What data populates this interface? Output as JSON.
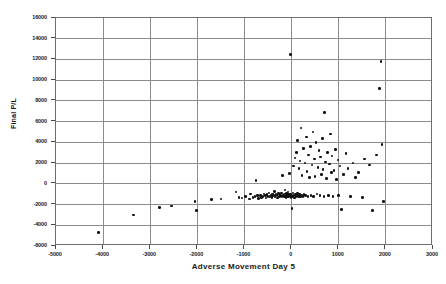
{
  "chart_data": {
    "type": "scatter",
    "title": "",
    "xlabel": "Adverse Movement Day 5",
    "ylabel": "Final P/L",
    "xlim": [
      -5000,
      3000
    ],
    "ylim": [
      -6000,
      16000
    ],
    "xticks": [
      -5000,
      -4000,
      -3000,
      -2000,
      -1000,
      0,
      1000,
      2000,
      3000
    ],
    "xtick_labels": [
      "-5000",
      "-4000",
      "-3000",
      "-2000",
      "-1000",
      "0",
      "1000",
      "2000",
      "3000"
    ],
    "yticks": [
      -6000,
      -4000,
      -2000,
      0,
      2000,
      4000,
      6000,
      8000,
      10000,
      12000,
      14000,
      16000
    ],
    "ytick_labels": [
      "-6000",
      "-4000",
      "-2000",
      "0",
      "2000",
      "4000",
      "6000",
      "8000",
      "10000",
      "12000",
      "14000",
      "16000"
    ],
    "grid": true,
    "grid_axis": "both",
    "legend": false,
    "marker": "filled-circle",
    "marker_color": "#111111",
    "series": [
      {
        "name": "trades",
        "points": [
          [
            -4100,
            -4700
          ],
          [
            -3350,
            -3000
          ],
          [
            -2800,
            -2300
          ],
          [
            -2550,
            -2150
          ],
          [
            -2050,
            -1700
          ],
          [
            -2020,
            -2600
          ],
          [
            -1700,
            -1500
          ],
          [
            -1500,
            -1450
          ],
          [
            -1180,
            -800
          ],
          [
            -1120,
            -1300
          ],
          [
            -1050,
            -1350
          ],
          [
            -980,
            -1200
          ],
          [
            -900,
            -1450
          ],
          [
            -870,
            -1000
          ],
          [
            -820,
            -1300
          ],
          [
            -780,
            -1250
          ],
          [
            -760,
            300
          ],
          [
            -720,
            -1150
          ],
          [
            -700,
            -1400
          ],
          [
            -660,
            -1100
          ],
          [
            -640,
            -1300
          ],
          [
            -610,
            -1200
          ],
          [
            -590,
            -1000
          ],
          [
            -560,
            -1150
          ],
          [
            -540,
            -1350
          ],
          [
            -520,
            -1050
          ],
          [
            -500,
            -1250
          ],
          [
            -480,
            -900
          ],
          [
            -460,
            -1200
          ],
          [
            -440,
            -1100
          ],
          [
            -420,
            -1300
          ],
          [
            -400,
            -1000
          ],
          [
            -380,
            -1150
          ],
          [
            -360,
            -750
          ],
          [
            -350,
            -1250
          ],
          [
            -330,
            -1050
          ],
          [
            -310,
            -1150
          ],
          [
            -300,
            -1350
          ],
          [
            -280,
            -950
          ],
          [
            -260,
            -1200
          ],
          [
            -250,
            -1050
          ],
          [
            -230,
            -1150
          ],
          [
            -210,
            -900
          ],
          [
            -200,
            -1250
          ],
          [
            -190,
            800
          ],
          [
            -180,
            -1100
          ],
          [
            -160,
            -1000
          ],
          [
            -150,
            -1200
          ],
          [
            -140,
            -600
          ],
          [
            -130,
            -1150
          ],
          [
            -120,
            -1300
          ],
          [
            -110,
            -950
          ],
          [
            -100,
            -1100
          ],
          [
            -90,
            -1250
          ],
          [
            -80,
            -800
          ],
          [
            -70,
            -1050
          ],
          [
            -60,
            -1200
          ],
          [
            -50,
            1000
          ],
          [
            -40,
            -1150
          ],
          [
            -30,
            12500
          ],
          [
            -20,
            -1000
          ],
          [
            -10,
            -1300
          ],
          [
            0,
            -1100
          ],
          [
            10,
            -2400
          ],
          [
            20,
            -1200
          ],
          [
            30,
            -900
          ],
          [
            40,
            1700
          ],
          [
            50,
            -1150
          ],
          [
            60,
            -1350
          ],
          [
            70,
            2500
          ],
          [
            80,
            -1050
          ],
          [
            90,
            -1200
          ],
          [
            100,
            3000
          ],
          [
            110,
            -1100
          ],
          [
            120,
            -950
          ],
          [
            130,
            4200
          ],
          [
            140,
            -1250
          ],
          [
            150,
            -1150
          ],
          [
            160,
            1500
          ],
          [
            170,
            -1000
          ],
          [
            180,
            2200
          ],
          [
            190,
            -1200
          ],
          [
            200,
            5400
          ],
          [
            210,
            -1100
          ],
          [
            220,
            800
          ],
          [
            240,
            -1250
          ],
          [
            250,
            3400
          ],
          [
            260,
            -1050
          ],
          [
            280,
            2000
          ],
          [
            300,
            -1150
          ],
          [
            310,
            4500
          ],
          [
            330,
            1200
          ],
          [
            350,
            -1200
          ],
          [
            360,
            2800
          ],
          [
            380,
            600
          ],
          [
            400,
            3600
          ],
          [
            410,
            -1100
          ],
          [
            430,
            1800
          ],
          [
            450,
            5000
          ],
          [
            470,
            -1250
          ],
          [
            490,
            2400
          ],
          [
            500,
            700
          ],
          [
            520,
            4000
          ],
          [
            540,
            -1000
          ],
          [
            560,
            1600
          ],
          [
            580,
            3200
          ],
          [
            600,
            -1150
          ],
          [
            610,
            2600
          ],
          [
            630,
            900
          ],
          [
            650,
            4400
          ],
          [
            670,
            1400
          ],
          [
            690,
            -1200
          ],
          [
            700,
            6900
          ],
          [
            720,
            2100
          ],
          [
            740,
            500
          ],
          [
            760,
            3000
          ],
          [
            780,
            -1100
          ],
          [
            800,
            1900
          ],
          [
            820,
            4800
          ],
          [
            840,
            1100
          ],
          [
            860,
            2700
          ],
          [
            880,
            -1250
          ],
          [
            900,
            1300
          ],
          [
            930,
            3300
          ],
          [
            950,
            400
          ],
          [
            980,
            2300
          ],
          [
            1000,
            -1150
          ],
          [
            1030,
            1700
          ],
          [
            1060,
            -2500
          ],
          [
            1100,
            900
          ],
          [
            1150,
            2900
          ],
          [
            1200,
            1500
          ],
          [
            1250,
            -1200
          ],
          [
            1300,
            2000
          ],
          [
            1350,
            600
          ],
          [
            1420,
            1100
          ],
          [
            1500,
            -1300
          ],
          [
            1550,
            2400
          ],
          [
            1650,
            1800
          ],
          [
            1720,
            -2600
          ],
          [
            1800,
            2800
          ],
          [
            1870,
            9200
          ],
          [
            1900,
            11800
          ],
          [
            1920,
            3800
          ],
          [
            1950,
            -1700
          ]
        ]
      }
    ]
  }
}
